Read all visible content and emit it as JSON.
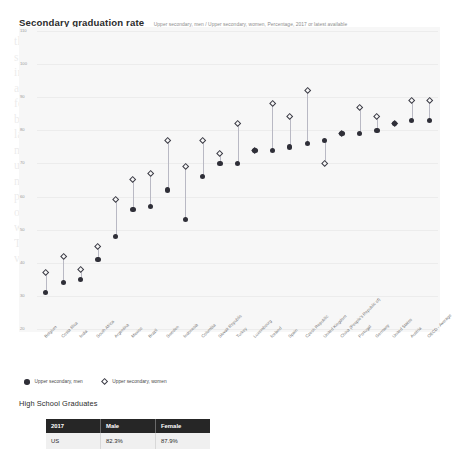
{
  "header": {
    "title": "Secondary graduation rate",
    "subtitle": "Upper secondary, men / Upper secondary, women, Percentage, 2017 or latest available"
  },
  "legend": {
    "items": [
      {
        "label": "Upper secondary, men",
        "marker": "filled-circle",
        "color": "#2f2f38"
      },
      {
        "label": "Upper secondary, women",
        "marker": "hollow-diamond",
        "color": "#3a3a44"
      }
    ]
  },
  "table": {
    "title": "High School Graduates",
    "columns": [
      "2017",
      "Male",
      "Female"
    ],
    "rows": [
      [
        "US",
        "82.3%",
        "87.9%"
      ]
    ]
  },
  "chart_data": {
    "type": "scatter",
    "title": "Secondary graduation rate",
    "subtitle": "Upper secondary, men / Upper secondary, women, Percentage, 2017 or latest available",
    "xlabel": "",
    "ylabel": "",
    "ylim": [
      20,
      110
    ],
    "yticks": [
      20,
      30,
      40,
      50,
      60,
      70,
      80,
      90,
      100,
      110
    ],
    "grid": true,
    "legend_position": "bottom-left",
    "categories": [
      "Belgium",
      "Costa Rica",
      "India",
      "South Africa",
      "Argentina",
      "Mexico",
      "Brazil",
      "Sweden",
      "Indonesia",
      "Colombia",
      "Slovak Republic",
      "Turkey",
      "Luxembourg",
      "Iceland",
      "Spain",
      "Czech Republic",
      "United Kingdom",
      "China (People's Republic of)",
      "Portugal",
      "Germany",
      "United States",
      "Austria",
      "OECD - Average"
    ],
    "series": [
      {
        "name": "Upper secondary, men",
        "marker": "filled-circle",
        "color": "#2f2f38",
        "values": [
          31,
          34,
          35,
          41,
          48,
          56,
          57,
          62,
          53,
          66,
          70,
          70,
          74,
          74,
          75,
          76,
          77,
          79,
          79,
          80,
          82,
          83,
          83
        ]
      },
      {
        "name": "Upper secondary, women",
        "marker": "hollow-diamond",
        "color": "#3a3a44",
        "values": [
          37,
          42,
          38,
          45,
          59,
          65,
          67,
          77,
          69,
          77,
          73,
          82,
          74,
          88,
          84,
          92,
          70,
          79,
          87,
          84,
          82,
          89,
          89
        ]
      }
    ]
  }
}
